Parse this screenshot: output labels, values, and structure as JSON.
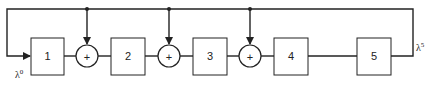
{
  "diagram": {
    "blocks": [
      {
        "id": "1",
        "label": "1"
      },
      {
        "id": "2",
        "label": "2"
      },
      {
        "id": "3",
        "label": "3"
      },
      {
        "id": "4",
        "label": "4"
      },
      {
        "id": "5",
        "label": "5"
      }
    ],
    "adders": [
      {
        "id": "adder-1",
        "symbol": "+"
      },
      {
        "id": "adder-2",
        "symbol": "+"
      },
      {
        "id": "adder-3",
        "symbol": "+"
      }
    ],
    "input_label": {
      "base": "λ",
      "sup": "0"
    },
    "output_label": {
      "base": "λ",
      "sup": "5"
    }
  }
}
